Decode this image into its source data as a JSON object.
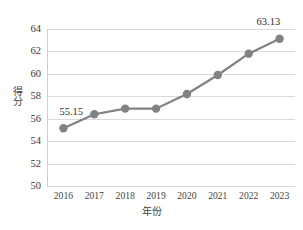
{
  "chart_data": {
    "type": "line",
    "title": "",
    "xlabel": "年份",
    "ylabel": "得分",
    "categories": [
      "2016",
      "2017",
      "2018",
      "2019",
      "2020",
      "2021",
      "2022",
      "2023"
    ],
    "values": [
      55.15,
      56.4,
      56.9,
      56.9,
      58.2,
      59.9,
      61.8,
      63.13
    ],
    "series": [
      {
        "name": "得分",
        "values": [
          55.15,
          56.4,
          56.9,
          56.9,
          58.2,
          59.9,
          61.8,
          63.13
        ]
      }
    ],
    "point_labels": [
      {
        "index": 0,
        "text": "55.15"
      },
      {
        "index": 7,
        "text": "63.13"
      }
    ],
    "ylim": [
      50,
      64
    ],
    "yticks": [
      50,
      52,
      54,
      56,
      58,
      60,
      62,
      64
    ],
    "ytick_labels": [
      "50",
      "52",
      "54",
      "56",
      "58",
      "60",
      "62",
      "64"
    ],
    "xtick_labels": [
      "2016",
      "2017",
      "2018",
      "2019",
      "2020",
      "2021",
      "2022",
      "2023"
    ],
    "grid": true,
    "grid_axis": "y",
    "legend": false,
    "legend_position": "none",
    "colors": {
      "series": "#808285",
      "marker": "#808285",
      "gridline": "#d9d9d9",
      "axis": "#cfcfcf",
      "text": "#3f3f3f",
      "background": "#ffffff"
    },
    "marker": "circle",
    "line_width": 2.2,
    "marker_size": 4.2
  }
}
